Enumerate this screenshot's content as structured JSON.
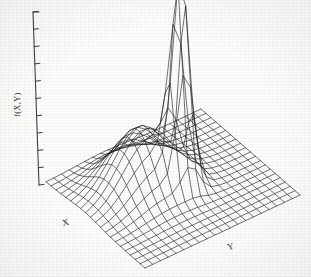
{
  "figure": {
    "type": "3d-surface-mesh",
    "background_color": "#fdfdfc",
    "line_color": "#1b1b1b",
    "axis_color": "#3a3a3a"
  },
  "axes": {
    "vertical": {
      "label": "f(X,Y)",
      "tick_count": 11,
      "ticks_visible": true,
      "tick_labels": []
    },
    "x": {
      "label": "X",
      "tick_labels": []
    },
    "y": {
      "label": "Y",
      "tick_labels": []
    }
  },
  "chart_data": {
    "type": "surface",
    "title": "",
    "xlabel": "X",
    "ylabel": "Y",
    "zlabel": "f(X,Y)",
    "grid": true,
    "legend": "none",
    "projection": "isometric-wireframe",
    "grid_divisions": {
      "x": 20,
      "y": 20
    },
    "xlim": [
      -4,
      4
    ],
    "ylim": [
      -4,
      4
    ],
    "zlim": [
      0,
      1
    ],
    "surface_model": "f(x,y) = 1.0*exp(-((x-0.35)^2+(y-0.15)^2)/(2*0.42^2)) + 0.30*exp(-((x+0.95)^2+(y+1.05)^2)/(2*1.25^2))",
    "components": [
      {
        "name": "tall narrow peak",
        "amplitude": 1.0,
        "center_x": 0.35,
        "center_y": 0.15,
        "sigma": 0.42
      },
      {
        "name": "broad low mound",
        "amplitude": 0.3,
        "center_x": -0.95,
        "center_y": -1.05,
        "sigma": 1.25
      }
    ],
    "z_tick_values": [
      0,
      0.1,
      0.2,
      0.3,
      0.4,
      0.5,
      0.6,
      0.7,
      0.8,
      0.9,
      1.0
    ]
  }
}
